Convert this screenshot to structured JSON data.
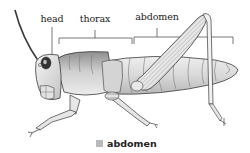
{
  "diagram": {
    "labels": {
      "head": "head",
      "thorax": "thorax",
      "abdomen": "abdomen"
    },
    "legend": {
      "swatch_color": "#b9b9b9",
      "text": "abdomen"
    },
    "colors": {
      "outline": "#3a3a3a",
      "body_light": "#f2f2f2",
      "body_mid": "#d6d6d6",
      "body_dark": "#9a9a9a",
      "bracket": "#555555"
    }
  }
}
